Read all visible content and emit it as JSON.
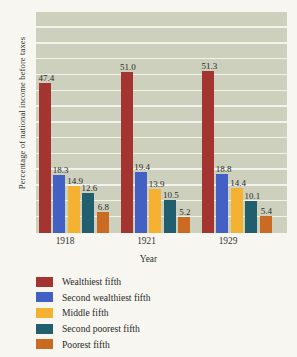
{
  "chart_data": {
    "type": "bar",
    "title": "",
    "xlabel": "Year",
    "ylabel": "Percentage of national income before taxes",
    "categories": [
      "1918",
      "1921",
      "1929"
    ],
    "ylim": [
      0,
      70
    ],
    "yticks": [
      0,
      5,
      10,
      15,
      20,
      25,
      30,
      35,
      40,
      45,
      50,
      55,
      60,
      65,
      70
    ],
    "ytick_labels": [
      "0",
      "5",
      "10",
      "15",
      "20",
      "25",
      "30",
      "35",
      "40",
      "45",
      "50",
      "55",
      "60",
      "65",
      "70"
    ],
    "grid": true,
    "legend_position": "below",
    "series": [
      {
        "name": "Wealthiest fifth",
        "color": "#a3342f",
        "values": [
          47.4,
          51.0,
          51.3
        ],
        "labels": [
          "47.4",
          "51.0",
          "51.3"
        ]
      },
      {
        "name": "Second wealthiest fifth",
        "color": "#4360c4",
        "values": [
          18.3,
          19.4,
          18.8
        ],
        "labels": [
          "18.3",
          "19.4",
          "18.8"
        ]
      },
      {
        "name": "Middle fifth",
        "color": "#f5b231",
        "values": [
          14.9,
          13.9,
          14.4
        ],
        "labels": [
          "14.9",
          "13.9",
          "14.4"
        ]
      },
      {
        "name": "Second poorest fifth",
        "color": "#225f6e",
        "values": [
          12.6,
          10.5,
          10.1
        ],
        "labels": [
          "12.6",
          "10.5",
          "10.1"
        ]
      },
      {
        "name": "Poorest fifth",
        "color": "#cb6a22",
        "values": [
          6.8,
          5.2,
          5.4
        ],
        "labels": [
          "6.8",
          "5.2",
          "5.4"
        ]
      }
    ],
    "plot_background": "#ccd0bc",
    "gridline_color": "#f2f3ec",
    "page_background": "#f7f6f1"
  }
}
